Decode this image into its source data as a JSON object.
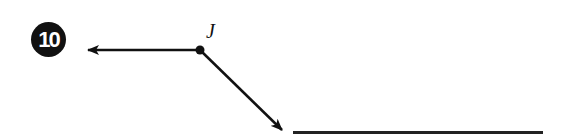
{
  "problem": {
    "number": "10",
    "point_label": "J",
    "rays": [
      {
        "name": "left-ray",
        "from": [
          200,
          50
        ],
        "to": [
          87,
          50
        ]
      },
      {
        "name": "diagonal-ray",
        "from": [
          200,
          50
        ],
        "to": [
          283,
          131
        ]
      }
    ],
    "answer_value": ""
  },
  "colors": {
    "ink": "#111111",
    "badge_text": "#ffffff",
    "background": "#ffffff"
  }
}
